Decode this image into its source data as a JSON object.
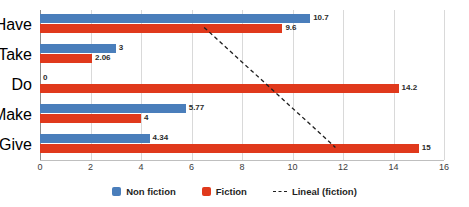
{
  "chart_data": {
    "type": "bar",
    "orientation": "horizontal",
    "title": "",
    "xlabel": "",
    "ylabel": "",
    "categories": [
      "Have",
      "Take",
      "Do",
      "Make",
      "Give"
    ],
    "series": [
      {
        "name": "Non fiction",
        "color": "#4a7ebb",
        "values": [
          10.7,
          3,
          0,
          5.77,
          4.34
        ],
        "labels": [
          "10.7",
          "3",
          "0",
          "5.77",
          "4.34"
        ]
      },
      {
        "name": "Fiction",
        "color": "#e0391c",
        "values": [
          9.6,
          2.06,
          14.2,
          4,
          15
        ],
        "labels": [
          "9.6",
          "2.06",
          "14.2",
          "4",
          "15"
        ]
      }
    ],
    "trendline": {
      "name": "Lineal (fiction)",
      "style": "dashed",
      "color": "#1f1f1f",
      "start": {
        "x": 6.5,
        "y_category_index": 0
      },
      "end": {
        "x": 11.7,
        "y_category_index": 4
      }
    },
    "xlim": [
      0,
      16
    ],
    "xticks": [
      0,
      2,
      4,
      6,
      8,
      10,
      12,
      14,
      16
    ],
    "xtick_labels": [
      "0",
      "2",
      "4",
      "6",
      "8",
      "10",
      "12",
      "14",
      "16"
    ],
    "grid": true,
    "grid_axis": "x",
    "legend": {
      "position": "bottom",
      "entries": [
        {
          "label": "Non fiction",
          "marker": "square",
          "color": "#4a7ebb"
        },
        {
          "label": "Fiction",
          "marker": "square",
          "color": "#e0391c"
        },
        {
          "label": "Lineal (fiction)",
          "marker": "dashed-line",
          "color": "#1f1f1f"
        }
      ]
    }
  }
}
